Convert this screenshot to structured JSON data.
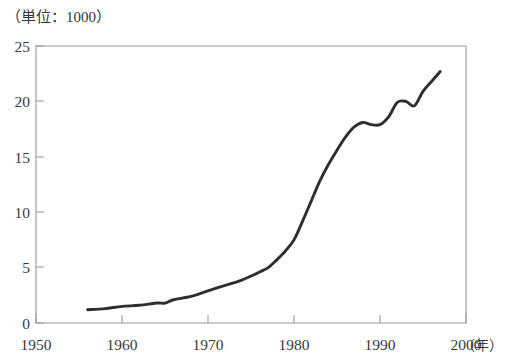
{
  "figure": {
    "unit_label": "（単位：1000）",
    "cropped_title_fragment": "",
    "line_color": "#2e2e2e",
    "axis_color": "#9a9a9a",
    "background_color": "#ffffff"
  },
  "chart_data": {
    "type": "line",
    "title": "",
    "subtitle": "",
    "xlabel": "（年）",
    "ylabel": "（単位：1000）",
    "xlim": [
      1950,
      2000
    ],
    "ylim": [
      0,
      25
    ],
    "grid": false,
    "legend": null,
    "x_ticks": [
      "1950",
      "1960",
      "1970",
      "1980",
      "1990",
      "2000"
    ],
    "x_tick_values": [
      1950,
      1960,
      1970,
      1980,
      1990,
      2000
    ],
    "y_ticks": [
      "0",
      "5",
      "10",
      "15",
      "20",
      "25"
    ],
    "y_tick_values": [
      0,
      5,
      10,
      15,
      20,
      25
    ],
    "x_unit_suffix": "（年）",
    "series": [
      {
        "name": "",
        "x": [
          1956,
          1958,
          1960,
          1962,
          1964,
          1965,
          1966,
          1968,
          1970,
          1972,
          1974,
          1976,
          1977,
          1978,
          1979,
          1980,
          1981,
          1982,
          1983,
          1984,
          1985,
          1986,
          1987,
          1988,
          1989,
          1990,
          1991,
          1992,
          1993,
          1994,
          1995,
          1996,
          1997
        ],
        "values": [
          1.2,
          1.3,
          1.5,
          1.6,
          1.8,
          1.8,
          2.1,
          2.4,
          2.9,
          3.4,
          3.9,
          4.6,
          5.0,
          5.7,
          6.5,
          7.5,
          9.2,
          11.0,
          12.8,
          14.3,
          15.6,
          16.8,
          17.7,
          18.1,
          17.9,
          17.9,
          18.6,
          19.9,
          20.0,
          19.6,
          20.9,
          21.8,
          22.7
        ]
      }
    ]
  }
}
